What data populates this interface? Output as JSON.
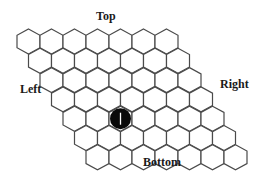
{
  "diagram": {
    "type": "hex-board",
    "rows": 7,
    "cols": 7,
    "labels": {
      "top": "Top",
      "right": "Right",
      "left": "Left",
      "bottom": "Bottom"
    },
    "stones": [
      {
        "row": 4,
        "col": 2,
        "color": "#0a0a0a",
        "mark": "I"
      }
    ],
    "colors": {
      "cell_fill": "#ffffff",
      "cell_stroke": "#4a4a4a",
      "stone": "#0a0a0a"
    }
  }
}
